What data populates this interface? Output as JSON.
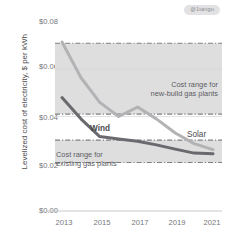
{
  "badge": {
    "text": "@1tangu"
  },
  "chart_data": {
    "type": "line",
    "title": "",
    "xlabel": "",
    "ylabel": "Levelized cost of electricity, $ per kWh",
    "xlim": [
      2013,
      2021
    ],
    "ylim": [
      0.0,
      0.08
    ],
    "grid": false,
    "legend_position": "inline-annotations",
    "x_ticks": [
      "2013",
      "2015",
      "2017",
      "2019",
      "2021"
    ],
    "x_tick_values": [
      2013,
      2015,
      2017,
      2019,
      2021
    ],
    "y_ticks": [
      "$0.00",
      "$0.02",
      "$0.04",
      "$0.06",
      "$0.08"
    ],
    "y_tick_values": [
      0.0,
      0.02,
      0.04,
      0.06,
      0.08
    ],
    "x": [
      2013,
      2014,
      2015,
      2016,
      2017,
      2018,
      2019,
      2020,
      2021
    ],
    "series": [
      {
        "name": "Solar",
        "color": "#b3b3b5",
        "values": [
          0.0715,
          0.0565,
          0.046,
          0.04,
          0.044,
          0.039,
          0.033,
          0.0285,
          0.026
        ]
      },
      {
        "name": "Wind",
        "color": "#696a6d",
        "values": [
          0.048,
          0.039,
          0.0315,
          0.0305,
          0.0295,
          0.028,
          0.0262,
          0.0245,
          0.0242
        ]
      }
    ],
    "bands": [
      {
        "name": "Cost range for new-build gas plants",
        "label_line1": "Cost range for",
        "label_line2": "new-build gas plants",
        "ymin": 0.041,
        "ymax": 0.071,
        "fill": "#dededf",
        "edge_style": "dash-dot",
        "edge_color": "#808084"
      },
      {
        "name": "Cost range for existing gas plants",
        "label_line1": "Cost range for",
        "label_line2": "existing gas plants",
        "ymin": 0.0205,
        "ymax": 0.03,
        "fill": "#dededf",
        "edge_style": "dash-dot",
        "edge_color": "#808084"
      }
    ]
  }
}
